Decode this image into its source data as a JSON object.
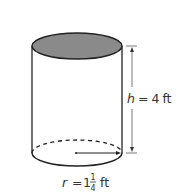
{
  "figure": {
    "shape": "cylinder",
    "top_fill": "#8a8a8a",
    "stroke": "#222222",
    "height_label": {
      "var": "h",
      "eq": "=",
      "value": "4",
      "unit": "ft"
    },
    "radius_label": {
      "var": "r",
      "eq": "=",
      "whole": "1",
      "numerator": "1",
      "denominator": "4",
      "unit": "ft"
    }
  }
}
